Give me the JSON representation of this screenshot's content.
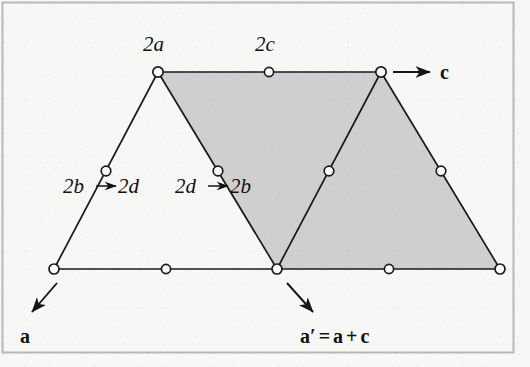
{
  "figure": {
    "background_color": "#f7f7f6",
    "border_color": "#b9b9b9",
    "shade_color": "#cfcfcf",
    "line_color": "#1a1a1a",
    "node_fill": "#fbfbfa"
  },
  "labels": {
    "top_left_vertex": "2a",
    "top_mid": "2c",
    "vector_c": "c",
    "left_map_from": "2b",
    "left_map_arrow": "→",
    "left_map_to": "2d",
    "mid_map_from": "2d",
    "mid_map_arrow": "→",
    "mid_map_to": "2b",
    "vector_a": "a",
    "vector_a_prime_lhs": "a",
    "vector_a_prime_mark": "′",
    "vector_a_prime_eq": "=",
    "vector_a_prime_term1": "a",
    "vector_a_prime_plus": "+",
    "vector_a_prime_term2": "c"
  },
  "chart_data": {
    "type": "diagram",
    "coordinate_space": {
      "width": 530,
      "height": 367
    },
    "nodes": [
      {
        "id": "n-top-left-apex",
        "x": 158,
        "y": 72,
        "label": "2a"
      },
      {
        "id": "n-top-mid",
        "x": 269,
        "y": 72,
        "label": "2c"
      },
      {
        "id": "n-top-right-apex",
        "x": 381,
        "y": 72,
        "label": ""
      },
      {
        "id": "n-left-mid",
        "x": 106,
        "y": 171,
        "label": "2b → 2d"
      },
      {
        "id": "n-center-left-mid",
        "x": 218,
        "y": 171,
        "label": "2d → 2b"
      },
      {
        "id": "n-center-right-mid",
        "x": 329,
        "y": 171,
        "label": ""
      },
      {
        "id": "n-right-mid",
        "x": 441,
        "y": 171,
        "label": ""
      },
      {
        "id": "n-bottom-left",
        "x": 54,
        "y": 269,
        "label": ""
      },
      {
        "id": "n-bottom-left-mid",
        "x": 166,
        "y": 269,
        "label": ""
      },
      {
        "id": "n-bottom-center",
        "x": 277,
        "y": 269,
        "label": ""
      },
      {
        "id": "n-bottom-right-mid",
        "x": 389,
        "y": 269,
        "label": ""
      },
      {
        "id": "n-bottom-right",
        "x": 500,
        "y": 269,
        "label": ""
      }
    ],
    "edges": [
      {
        "from": "n-top-left-apex",
        "to": "n-top-right-apex",
        "kind": "top-row"
      },
      {
        "from": "n-bottom-left",
        "to": "n-bottom-right",
        "kind": "bottom-row"
      },
      {
        "from": "n-bottom-left",
        "to": "n-top-left-apex",
        "kind": "left-triangle-left-side"
      },
      {
        "from": "n-top-left-apex",
        "to": "n-bottom-center",
        "kind": "left-triangle-right-side"
      },
      {
        "from": "n-bottom-center",
        "to": "n-top-right-apex",
        "kind": "right-triangle-left-side"
      },
      {
        "from": "n-top-right-apex",
        "to": "n-bottom-right",
        "kind": "right-triangle-right-side"
      }
    ],
    "shaded_regions": [
      {
        "id": "shaded-parallelogram",
        "points": "158,72 381,72 500,269 277,269",
        "fill": "#cfcfcf"
      }
    ],
    "vectors": [
      {
        "id": "vector-c",
        "label": "c",
        "from": [
          393,
          72
        ],
        "to": [
          430,
          72
        ],
        "direction": "right"
      },
      {
        "id": "vector-a",
        "label": "a",
        "from": [
          57,
          283
        ],
        "to": [
          32,
          312
        ],
        "direction": "down-left"
      },
      {
        "id": "vector-a-prime",
        "label": "a′ = a + c",
        "from": [
          287,
          283
        ],
        "to": [
          313,
          312
        ],
        "direction": "down-right"
      }
    ]
  }
}
